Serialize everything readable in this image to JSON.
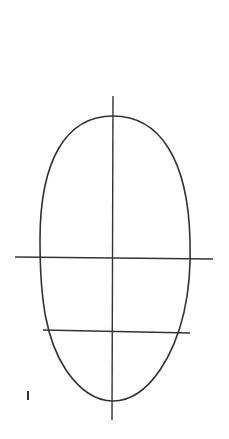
{
  "diagram": {
    "stroke_color": "#333333",
    "background": "#ffffff",
    "oval": {
      "top_y": 116,
      "bottom_y": 401,
      "left_x": 40,
      "right_x": 190,
      "center_x": 113
    },
    "vertical_axis": {
      "x": 113,
      "y1": 96,
      "y2": 420
    },
    "horizontal_guides": [
      {
        "name": "eye-line",
        "x1": 15,
        "x2": 213,
        "y": 258
      },
      {
        "name": "nose-line",
        "x1": 43,
        "x2": 190,
        "y": 331
      }
    ],
    "mark": {
      "text": "I",
      "x": 26,
      "y": 389
    }
  }
}
